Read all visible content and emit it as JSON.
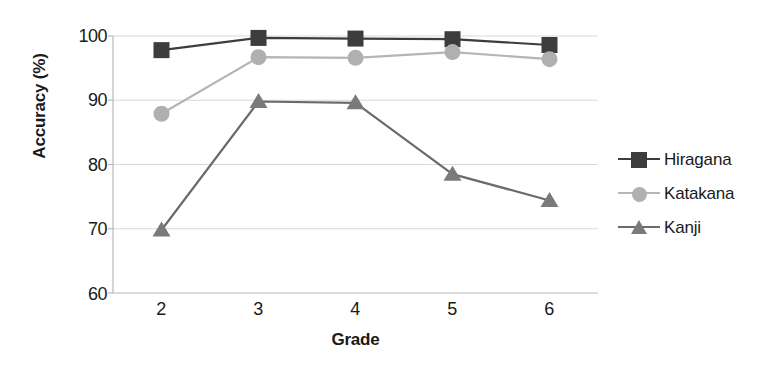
{
  "chart_data": {
    "type": "line",
    "title": "",
    "xlabel": "Grade",
    "ylabel": "Accuracy (%)",
    "categories": [
      "2",
      "3",
      "4",
      "5",
      "6"
    ],
    "x": [
      2,
      3,
      4,
      5,
      6
    ],
    "xlim": [
      1.5,
      6.5
    ],
    "ylim": [
      60,
      100
    ],
    "yticks": [
      "60",
      "70",
      "80",
      "90",
      "100"
    ],
    "ytick_values": [
      60,
      70,
      80,
      90,
      100
    ],
    "grid": "horizontal",
    "legend_position": "right",
    "series": [
      {
        "name": "Hiragana",
        "marker": "square",
        "color": "#3d3d3d",
        "line_color": "#3d3d3d",
        "values": [
          97.8,
          99.7,
          99.6,
          99.5,
          98.6
        ]
      },
      {
        "name": "Katakana",
        "marker": "circle",
        "color": "#b0b0b0",
        "line_color": "#b5b5b5",
        "values": [
          87.9,
          96.7,
          96.6,
          97.5,
          96.4
        ]
      },
      {
        "name": "Kanji",
        "marker": "triangle",
        "color": "#7a7a7a",
        "line_color": "#6b6b6b",
        "values": [
          69.8,
          89.8,
          89.6,
          78.5,
          74.4
        ]
      }
    ]
  },
  "legend": {
    "items": [
      {
        "label": "Hiragana"
      },
      {
        "label": "Katakana"
      },
      {
        "label": "Kanji"
      }
    ]
  },
  "colors": {
    "hiragana": "#3d3d3d",
    "katakana": "#b0b0b0",
    "kanji": "#7a7a7a",
    "grid": "#d9d9d9",
    "axis": "#b9b9b9",
    "text": "#1a1a1a"
  }
}
